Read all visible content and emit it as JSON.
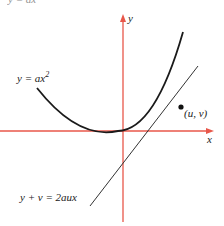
{
  "figure": {
    "top_caption_partial": "y = ax²",
    "curve_label": "y = ax",
    "curve_label_exponent": "2",
    "point_label": "(u, v)",
    "tangent_label": "y + v = 2aux",
    "x_axis_label": "x",
    "y_axis_label": "y",
    "colors": {
      "axis": "#e8574a",
      "curve": "#1a1a1a",
      "tangent": "#333333"
    }
  }
}
